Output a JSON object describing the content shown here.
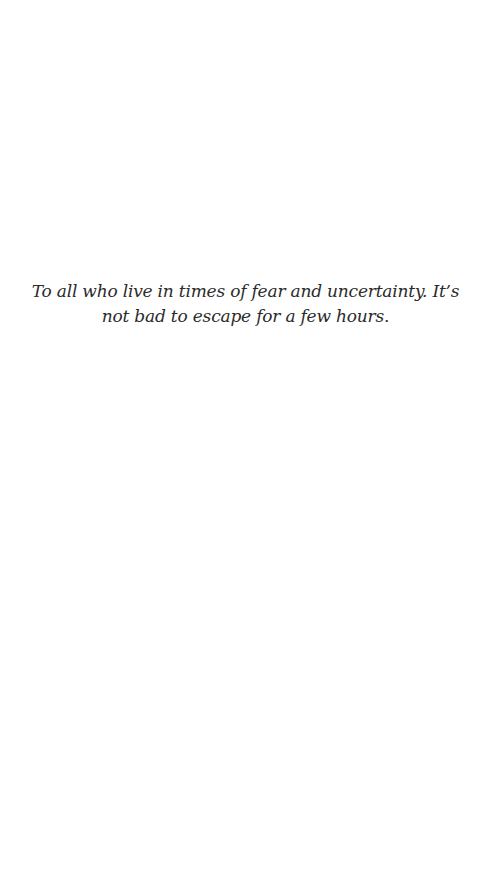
{
  "page": {
    "background_color": "#ffffff",
    "text_color": "#2b2b2b"
  },
  "dedication": {
    "text": "To all who live in times of fear and uncertainty. It’s not bad to escape for a few hours."
  }
}
